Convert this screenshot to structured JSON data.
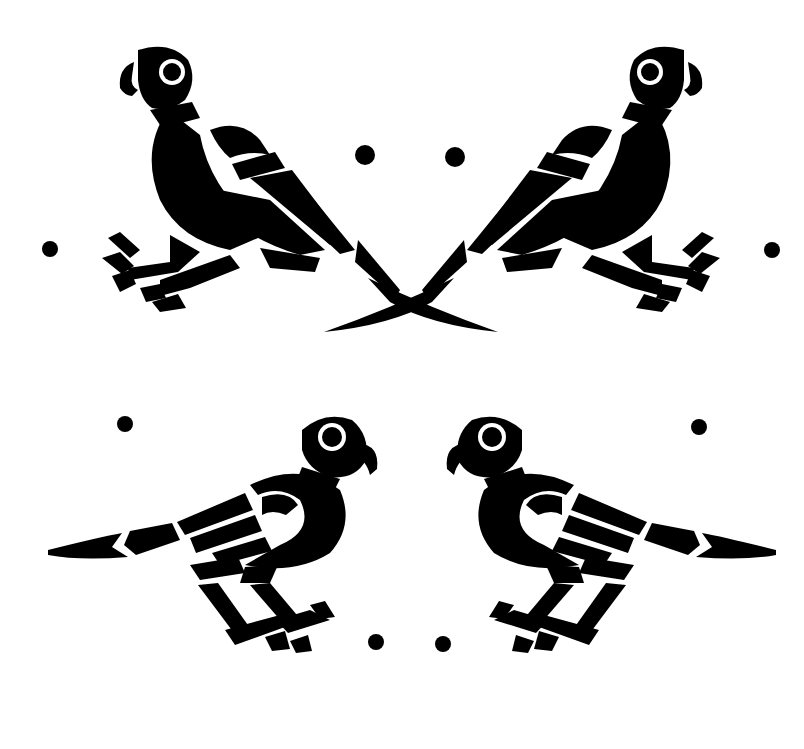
{
  "image": {
    "description": "Black and white stencil of four stylized parrots arranged symmetrically with decorative dots",
    "width": 804,
    "height": 749,
    "ink_color": "#000000",
    "background_color": "#ffffff"
  },
  "parrots": [
    {
      "position": "top-left",
      "facing": "left",
      "pose": "perched-crouching"
    },
    {
      "position": "top-right",
      "facing": "right",
      "pose": "perched-crouching"
    },
    {
      "position": "bottom-left",
      "facing": "right",
      "pose": "standing"
    },
    {
      "position": "bottom-right",
      "facing": "left",
      "pose": "standing"
    }
  ],
  "dots": [
    {
      "x": 50,
      "y": 249,
      "r": 8
    },
    {
      "x": 365,
      "y": 155,
      "r": 10
    },
    {
      "x": 455,
      "y": 157,
      "r": 10
    },
    {
      "x": 772,
      "y": 250,
      "r": 8
    },
    {
      "x": 125,
      "y": 424,
      "r": 8
    },
    {
      "x": 699,
      "y": 427,
      "r": 8
    },
    {
      "x": 376,
      "y": 642,
      "r": 8
    },
    {
      "x": 443,
      "y": 644,
      "r": 8
    }
  ]
}
